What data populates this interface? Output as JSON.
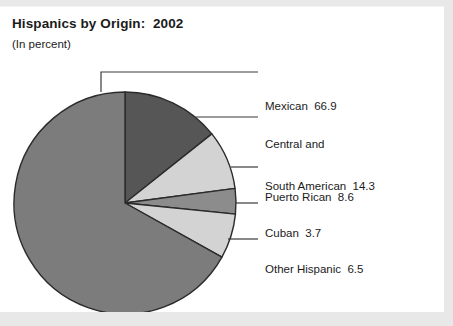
{
  "figure": {
    "title": "Hispanics by Origin:  2002",
    "subtitle": "(In percent)"
  },
  "colors": {
    "mexican": "#7c7c7c",
    "central_south_american": "#565656",
    "puerto_rican": "#d3d3d3",
    "cuban": "#8c8c8c",
    "other_hispanic": "#d3d3d3",
    "outline": "#2b2b2b",
    "leader_line": "#3a3a3a",
    "text": "#1b1b1b",
    "frame": "#e8e8e8",
    "background": "#ffffff"
  },
  "labels": {
    "mexican": "Mexican  66.9",
    "central_south_american_line1": "Central and",
    "central_south_american_line2": "South American  14.3",
    "puerto_rican": "Puerto Rican  8.6",
    "cuban": "Cuban  3.7",
    "other_hispanic": "Other Hispanic  6.5"
  },
  "chart_data": {
    "type": "pie",
    "title": "Hispanics by Origin:  2002",
    "subtitle": "(In percent)",
    "units": "percent",
    "legend_position": "right-callouts",
    "grid": false,
    "start_angle_deg": 0,
    "direction": "clockwise",
    "categories": [
      "Central and South American",
      "Puerto Rican",
      "Cuban",
      "Other Hispanic",
      "Mexican"
    ],
    "values": [
      14.3,
      8.6,
      3.7,
      6.5,
      66.9
    ],
    "slices": [
      {
        "name": "Central and South American",
        "value": 14.3,
        "label": "Central and South American  14.3",
        "color": "#565656",
        "start_deg": 0.0,
        "end_deg": 51.48
      },
      {
        "name": "Puerto Rican",
        "value": 8.6,
        "label": "Puerto Rican  8.6",
        "color": "#d3d3d3",
        "start_deg": 51.48,
        "end_deg": 82.44
      },
      {
        "name": "Cuban",
        "value": 3.7,
        "label": "Cuban  3.7",
        "color": "#8c8c8c",
        "start_deg": 82.44,
        "end_deg": 95.76
      },
      {
        "name": "Other Hispanic",
        "value": 6.5,
        "label": "Other Hispanic  6.5",
        "color": "#d3d3d3",
        "start_deg": 95.76,
        "end_deg": 119.16
      },
      {
        "name": "Mexican",
        "value": 66.9,
        "label": "Mexican  66.9",
        "color": "#7c7c7c",
        "start_deg": 119.16,
        "end_deg": 360.0
      }
    ]
  }
}
